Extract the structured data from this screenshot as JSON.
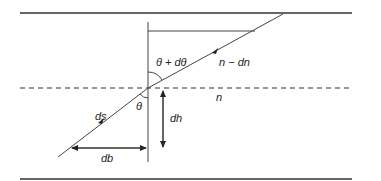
{
  "diagram": {
    "type": "ray refraction through layer with varying refractive index",
    "labels": {
      "theta_plus_dtheta": "θ + dθ",
      "n_minus_dn": "n − dn",
      "n": "n",
      "theta": "θ",
      "ds": "ds",
      "dh": "dh",
      "db": "db"
    },
    "colors": {
      "line": "#333333",
      "background": "#ffffff"
    }
  }
}
